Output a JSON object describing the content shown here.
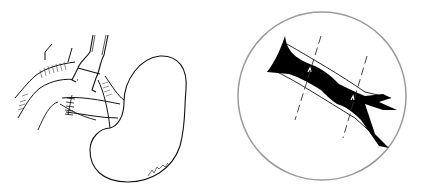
{
  "figure": {
    "type": "surgical-line-illustration",
    "panels": [
      {
        "id": "left",
        "subject": "kidney with clamped renal artery and sutured vessel",
        "elements": [
          "kidney",
          "renal-artery",
          "vascular-clamp",
          "suture-line",
          "aorta",
          "signature"
        ]
      },
      {
        "id": "right",
        "subject": "magnified circular inset of stenosed artery segment",
        "elements": [
          "inset-circle",
          "artery-lumen",
          "stenosis",
          "branch-bifurcation",
          "dashed-cut-line-1",
          "dashed-cut-line-2"
        ]
      }
    ],
    "signature_text": "(illegible artist signature)"
  },
  "colors": {
    "background": "#ffffff",
    "ink": "#111111",
    "circle": "#9a9a9a"
  }
}
